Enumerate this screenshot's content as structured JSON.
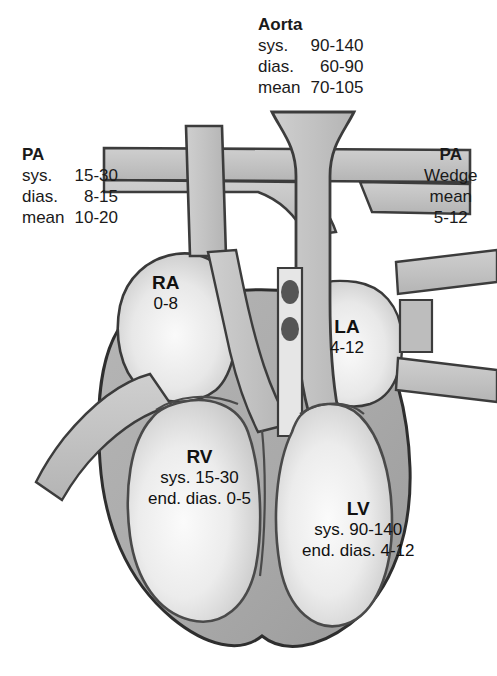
{
  "figure": {
    "type": "anatomical-diagram"
  },
  "palette": {
    "vessel_fill": "#c3c3c3",
    "myocardium": "#ababab",
    "chamber_light": "#f2f2f2",
    "outline": "#333333",
    "text": "#1a1a1a",
    "background": "#ffffff"
  },
  "callouts": {
    "aorta": {
      "title": "Aorta",
      "rows": [
        {
          "label": "sys.",
          "value": "90-140"
        },
        {
          "label": "dias.",
          "value": "60-90"
        },
        {
          "label": "mean",
          "value": "70-105"
        }
      ]
    },
    "pulmonary_artery": {
      "title": "PA",
      "rows": [
        {
          "label": "sys.",
          "value": "15-30"
        },
        {
          "label": "dias.",
          "value": "8-15"
        },
        {
          "label": "mean",
          "value": "10-20"
        }
      ]
    },
    "pa_wedge": {
      "line1": "PA",
      "line2": "Wedge",
      "line3": "mean",
      "line4": "5-12"
    }
  },
  "chambers": {
    "right_atrium": {
      "name": "RA",
      "line1": "0-8"
    },
    "left_atrium": {
      "name": "LA",
      "line1": "4-12"
    },
    "right_ventricle": {
      "name": "RV",
      "line1": "sys. 15-30",
      "line2": "end. dias. 0-5"
    },
    "left_ventricle": {
      "name": "LV",
      "line1": "sys. 90-140",
      "line2": "end. dias. 4-12"
    }
  },
  "structures": [
    "aorta",
    "pulmonary-artery",
    "superior-vena-cava",
    "inferior-vena-cava",
    "pulmonary-veins",
    "right-atrium",
    "left-atrium",
    "right-ventricle",
    "left-ventricle",
    "interventricular-septum",
    "valve-nodules"
  ]
}
